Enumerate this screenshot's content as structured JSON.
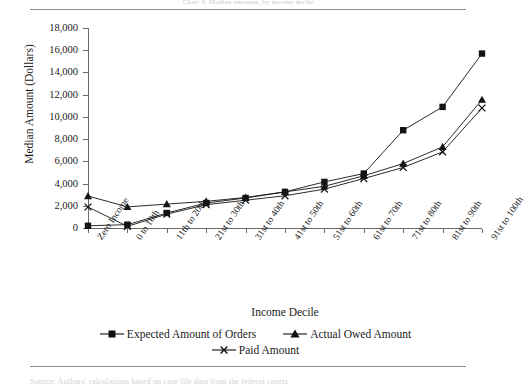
{
  "page": {
    "header_text": "Chart 3. Median amounts, by income decile",
    "footer_text": "Source: Authors' calculations based on case file data from the federal courts."
  },
  "chart_data": {
    "type": "line",
    "title": "",
    "xlabel": "Income Decile",
    "ylabel": "Median Amount (Dollars)",
    "ylim": [
      0,
      18000
    ],
    "ytick_step": 2000,
    "ytick_labels": [
      "18,000",
      "16,000",
      "14,000",
      "12,000",
      "10,000",
      "8,000",
      "6,000",
      "4,000",
      "2,000",
      "0"
    ],
    "grid": false,
    "legend_position": "bottom",
    "categories": [
      "Zero Income",
      "0 to 10th",
      "11th to 20th",
      "21st to 30th",
      "31st to 40th",
      "41st to 50th",
      "51st to 60th",
      "61st to 70th",
      "71st to 80th",
      "81st to 90th",
      "91st to 100th"
    ],
    "series": [
      {
        "name": "Expected Amount of Orders",
        "marker": "square",
        "values": [
          200,
          300,
          1350,
          2250,
          2700,
          3250,
          4150,
          4900,
          8800,
          10900,
          15700
        ]
      },
      {
        "name": "Actual Owed Amount",
        "marker": "triangle",
        "values": [
          2880,
          1900,
          2150,
          2400,
          2750,
          3250,
          3750,
          4700,
          5800,
          7300,
          11550
        ]
      },
      {
        "name": "Paid Amount",
        "marker": "cross",
        "values": [
          1890,
          150,
          1250,
          2100,
          2500,
          2900,
          3500,
          4450,
          5450,
          6850,
          10800
        ]
      }
    ]
  }
}
